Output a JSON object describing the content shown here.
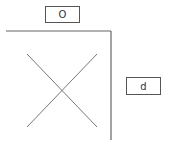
{
  "diagram": {
    "top_label": "O",
    "right_label": "d",
    "line_color": "#666666",
    "box_border_color": "#555555"
  }
}
